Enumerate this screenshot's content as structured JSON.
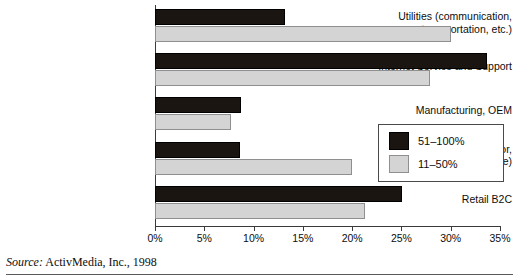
{
  "chart_data": {
    "type": "bar",
    "orientation": "horizontal",
    "title": "",
    "xlabel": "",
    "ylabel": "",
    "xlim": [
      0,
      35
    ],
    "xticks": [
      0,
      5,
      10,
      15,
      20,
      25,
      30,
      35
    ],
    "xtick_labels": [
      "0%",
      "5%",
      "10%",
      "15%",
      "20%",
      "25%",
      "30%",
      "35%"
    ],
    "grid": false,
    "legend_position": "right-middle",
    "categories": [
      "Utilities (communication,\ntransportation, etc.)",
      "Internet Service and Support",
      "Manufacturing, OEM",
      "B2B (wholesale, distributor,\nbusiness service)",
      "Retail B2C"
    ],
    "series": [
      {
        "name": "51–100%",
        "color": "#1b1512",
        "values": [
          13.2,
          33.7,
          8.7,
          8.6,
          25.1
        ]
      },
      {
        "name": "11–50%",
        "color": "#d4d4d4",
        "values": [
          30.0,
          27.9,
          7.7,
          20.0,
          21.3
        ]
      }
    ]
  },
  "categories": [
    {
      "line1": "Utilities (communication,",
      "line2": "transportation, etc.)"
    },
    {
      "line1": "Internet Service and Support",
      "line2": ""
    },
    {
      "line1": "Manufacturing, OEM",
      "line2": ""
    },
    {
      "line1": "B2B (wholesale, distributor,",
      "line2": "business service)"
    },
    {
      "line1": "Retail B2C",
      "line2": ""
    }
  ],
  "legend": {
    "items": [
      {
        "label": "51–100%"
      },
      {
        "label": "11–50%"
      }
    ]
  },
  "source": {
    "prefix": "Source:",
    "text": "ActivMedia, Inc., 1998"
  }
}
